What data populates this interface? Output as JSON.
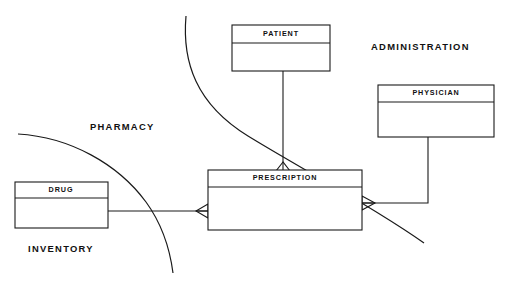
{
  "diagram": {
    "type": "entity-relationship-diagram",
    "canvas": {
      "width": 506,
      "height": 287,
      "background": "#ffffff",
      "line_color": "#1a1a1a"
    },
    "entities": [
      {
        "id": "patient",
        "name": "PATIENT",
        "x": 232,
        "y": 25,
        "width": 98,
        "height": 46,
        "header_height": 18
      },
      {
        "id": "physician",
        "name": "PHYSICIAN",
        "x": 378,
        "y": 85,
        "width": 116,
        "height": 52,
        "header_height": 17
      },
      {
        "id": "prescription",
        "name": "PRESCRIPTION",
        "x": 208,
        "y": 170,
        "width": 154,
        "height": 60,
        "header_height": 17
      },
      {
        "id": "drug",
        "name": "DRUG",
        "x": 15,
        "y": 182,
        "width": 93,
        "height": 46,
        "header_height": 16
      }
    ],
    "subject_areas": [
      {
        "id": "pharmacy",
        "label": "PHARMACY",
        "x": 90,
        "y": 128
      },
      {
        "id": "administration",
        "label": "ADMINISTRATION",
        "x": 371,
        "y": 48
      },
      {
        "id": "inventory",
        "label": "INVENTORY",
        "x": 28,
        "y": 250
      }
    ],
    "boundaries": [
      {
        "id": "pharmacy-administration-divider",
        "path": "M 186 16 C 182 62 196 104 248 136 C 300 168 372 206 424 243"
      },
      {
        "id": "pharmacy-inventory-divider",
        "path": "M 18 134 C 70 137 118 164 146 202 C 162 224 170 250 173 273"
      }
    ],
    "relationships": [
      {
        "id": "patient-prescription",
        "from": "patient",
        "to": "prescription",
        "path": "M 283 71 L 283 163",
        "cardinality_marker": "crows-foot-many",
        "marker_position": "top-of-prescription"
      },
      {
        "id": "drug-prescription",
        "from": "drug",
        "to": "prescription",
        "path": "M 108 211 L 208 211",
        "cardinality_marker": "crows-foot-many",
        "marker_position": "left-of-prescription"
      },
      {
        "id": "physician-prescription",
        "from": "physician",
        "to": "prescription",
        "path": "M 428 137 L 428 203 L 362 203",
        "cardinality_marker": "crows-foot-many",
        "marker_position": "right-of-prescription"
      }
    ]
  }
}
